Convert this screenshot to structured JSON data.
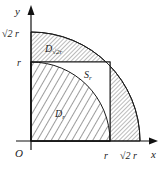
{
  "figure": {
    "axis_x_label": "x",
    "axis_y_label": "y",
    "origin_label": "O",
    "tick_r_x": "r",
    "tick_sqrt2r_x": "√2 r",
    "tick_r_y": "r",
    "tick_sqrt2r_y": "√2 r",
    "region_outer_label": "D√2r",
    "region_outer_main": "D",
    "region_outer_sub": "√2r",
    "region_inner_label": "Dr",
    "region_inner_main": "D",
    "region_inner_sub": "r",
    "region_square_label": "Sr",
    "region_square_main": "S",
    "region_square_sub": "r",
    "caption": ""
  },
  "colors": {
    "line": "#1a1a1a",
    "hatch": "#333333",
    "background": "#ffffff"
  }
}
